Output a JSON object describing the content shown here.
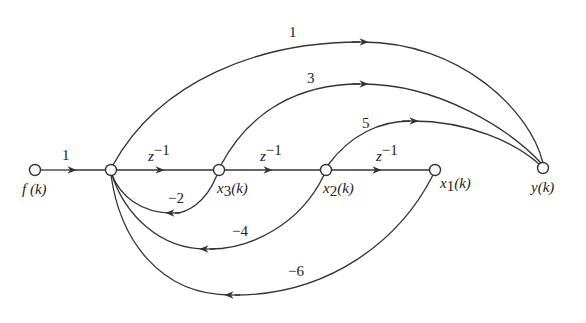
{
  "diagram": {
    "type": "signal-flow-graph",
    "colors": {
      "stroke": "#333333",
      "text": "#222222",
      "background": "#ffffff"
    },
    "nodes": [
      {
        "id": "f",
        "label": "f (k)",
        "x": 35,
        "y": 170
      },
      {
        "id": "a",
        "label": "",
        "x": 111,
        "y": 170
      },
      {
        "id": "x3",
        "label": "x3(k)",
        "x": 219,
        "y": 170
      },
      {
        "id": "x2",
        "label": "x2(k)",
        "x": 326,
        "y": 170
      },
      {
        "id": "x1",
        "label": "x1(k)",
        "x": 435,
        "y": 170
      },
      {
        "id": "y",
        "label": "y(k)",
        "x": 543,
        "y": 168
      }
    ],
    "edges": [
      {
        "from": "f",
        "to": "a",
        "gain": "1"
      },
      {
        "from": "a",
        "to": "x3",
        "gain": "z⁻¹"
      },
      {
        "from": "x3",
        "to": "x2",
        "gain": "z⁻¹"
      },
      {
        "from": "x2",
        "to": "x1",
        "gain": "z⁻¹"
      },
      {
        "from": "a",
        "to": "y",
        "gain": "1"
      },
      {
        "from": "x3",
        "to": "y",
        "gain": "3"
      },
      {
        "from": "x2",
        "to": "y",
        "gain": "5"
      },
      {
        "from": "x3",
        "to": "a",
        "gain": "−2"
      },
      {
        "from": "x2",
        "to": "a",
        "gain": "−4"
      },
      {
        "from": "x1",
        "to": "a",
        "gain": "−6"
      }
    ],
    "labels": {
      "f_node": "f (k)",
      "x3_main": "x",
      "x3_sub": "3",
      "x2_main": "x",
      "x2_sub": "2",
      "x1_main": "x",
      "x1_sub": "1",
      "arg_k": "(k)",
      "y_node": "y(k)",
      "gain_f_a": "1",
      "gain_z": "z",
      "gain_z_exp": "−1",
      "gain_a_y": "1",
      "gain_x3_y": "3",
      "gain_x2_y": "5",
      "gain_fb_x3": "−2",
      "gain_fb_x2": "−4",
      "gain_fb_x1": "−6"
    }
  }
}
